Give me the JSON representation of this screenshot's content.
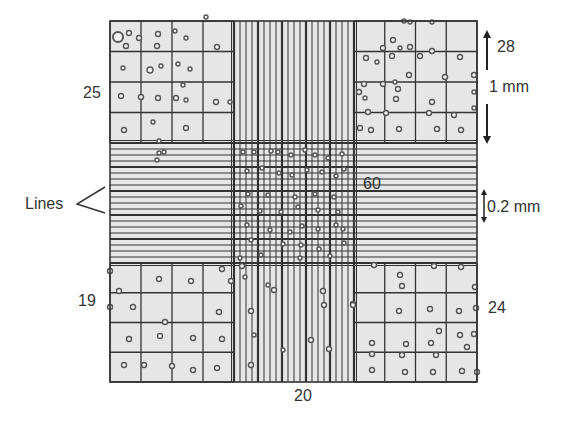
{
  "figure": {
    "colors": {
      "background": "#ffffff",
      "grid_fill": "#e6e6e6",
      "line": "#333333",
      "cell": "#555555"
    }
  },
  "labels": {
    "top_left_count": "25",
    "top_right_count": "28",
    "bottom_left_count": "19",
    "bottom_right_count": "24",
    "center_count": "60",
    "bottom_center_count": "20",
    "large_square_size": "1 mm",
    "small_square_size": "0.2 mm",
    "lines_pointer": "Lines"
  },
  "grid": {
    "outer": {
      "x0": 110,
      "y0": 21,
      "x1": 477,
      "y1": 382
    },
    "center_band": {
      "x0": 234,
      "x1": 354,
      "y0": 143,
      "y1": 263
    },
    "corner_subdivisions": 4,
    "center_subdivisions": 5,
    "lines_per_center_subdivision": 4
  },
  "cells": {
    "top_left": [
      [
        118,
        37,
        5
      ],
      [
        129,
        33,
        2.5
      ],
      [
        126,
        46,
        2.5
      ],
      [
        139,
        38,
        2.5
      ],
      [
        158,
        34,
        2.5
      ],
      [
        157,
        46,
        2.5
      ],
      [
        175,
        31,
        2
      ],
      [
        186,
        38,
        2
      ],
      [
        123,
        68,
        2
      ],
      [
        150,
        70,
        3
      ],
      [
        161,
        66,
        2
      ],
      [
        178,
        64,
        2
      ],
      [
        190,
        69,
        2
      ],
      [
        121,
        96,
        2.5
      ],
      [
        141,
        97,
        2.5
      ],
      [
        158,
        98,
        2.5
      ],
      [
        186,
        100,
        2
      ],
      [
        176,
        98,
        2.5
      ],
      [
        216,
        102,
        2.5
      ],
      [
        183,
        85,
        2
      ],
      [
        124,
        130,
        2.5
      ],
      [
        186,
        128,
        2.5
      ],
      [
        153,
        122,
        2
      ],
      [
        159,
        141,
        2
      ],
      [
        206,
        17,
        2
      ],
      [
        217,
        47,
        2.5
      ],
      [
        230,
        102,
        2
      ]
    ],
    "top_right": [
      [
        410,
        22,
        2
      ],
      [
        432,
        22,
        2
      ],
      [
        392,
        56,
        2.5
      ],
      [
        410,
        47,
        2.5
      ],
      [
        420,
        56,
        2.5
      ],
      [
        432,
        51,
        2.5
      ],
      [
        460,
        57,
        2.5
      ],
      [
        366,
        58,
        2.5
      ],
      [
        383,
        48,
        2.5
      ],
      [
        393,
        40,
        2.5
      ],
      [
        377,
        62,
        2
      ],
      [
        400,
        48,
        2
      ],
      [
        364,
        84,
        2.5
      ],
      [
        383,
        84,
        2.5
      ],
      [
        395,
        82,
        2
      ],
      [
        398,
        89,
        2.5
      ],
      [
        409,
        75,
        2.5
      ],
      [
        445,
        77,
        2.5
      ],
      [
        474,
        75,
        2.5
      ],
      [
        359,
        92,
        2.5
      ],
      [
        365,
        98,
        2
      ],
      [
        396,
        99,
        2.5
      ],
      [
        432,
        102,
        2.5
      ],
      [
        474,
        108,
        2
      ],
      [
        368,
        112,
        2.5
      ],
      [
        386,
        113,
        2.5
      ],
      [
        429,
        113,
        2.5
      ],
      [
        454,
        115,
        2.5
      ],
      [
        360,
        128,
        2.5
      ],
      [
        371,
        130,
        2.5
      ],
      [
        399,
        129,
        2.5
      ],
      [
        437,
        129,
        2.5
      ],
      [
        461,
        130,
        2.5
      ],
      [
        474,
        92,
        2
      ],
      [
        404,
        21,
        2
      ]
    ],
    "center": [
      [
        243,
        152,
        2
      ],
      [
        254,
        152,
        2
      ],
      [
        271,
        151,
        2
      ],
      [
        278,
        152,
        2
      ],
      [
        291,
        155,
        2
      ],
      [
        305,
        150,
        2
      ],
      [
        315,
        155,
        2
      ],
      [
        328,
        158,
        2
      ],
      [
        342,
        154,
        2
      ],
      [
        247,
        171,
        2
      ],
      [
        262,
        168,
        2
      ],
      [
        279,
        173,
        2
      ],
      [
        292,
        175,
        2
      ],
      [
        307,
        170,
        2
      ],
      [
        322,
        172,
        2
      ],
      [
        336,
        176,
        2
      ],
      [
        344,
        169,
        2
      ],
      [
        248,
        194,
        2
      ],
      [
        268,
        195,
        2
      ],
      [
        295,
        197,
        2
      ],
      [
        315,
        194,
        2
      ],
      [
        334,
        197,
        2
      ],
      [
        241,
        206,
        2
      ],
      [
        260,
        211,
        2
      ],
      [
        281,
        212,
        2
      ],
      [
        298,
        207,
        2
      ],
      [
        318,
        210,
        2
      ],
      [
        338,
        212,
        2
      ],
      [
        247,
        225,
        2
      ],
      [
        270,
        230,
        2
      ],
      [
        290,
        232,
        2
      ],
      [
        302,
        226,
        2
      ],
      [
        318,
        229,
        2
      ],
      [
        336,
        225,
        2
      ],
      [
        343,
        229,
        2
      ],
      [
        251,
        240,
        2
      ],
      [
        283,
        244,
        2
      ],
      [
        301,
        245,
        2
      ],
      [
        319,
        249,
        2
      ],
      [
        344,
        243,
        2
      ],
      [
        240,
        258,
        2
      ],
      [
        261,
        255,
        2
      ],
      [
        300,
        258,
        2
      ],
      [
        330,
        256,
        2
      ],
      [
        159,
        153,
        2
      ],
      [
        157,
        160,
        2
      ],
      [
        164,
        152,
        2
      ]
    ],
    "bottom_left": [
      [
        110,
        271,
        2.5
      ],
      [
        159,
        279,
        2.5
      ],
      [
        191,
        281,
        2.5
      ],
      [
        222,
        269,
        2.5
      ],
      [
        231,
        281,
        2.5
      ],
      [
        119,
        291,
        2.5
      ],
      [
        110,
        307,
        2.5
      ],
      [
        133,
        307,
        2.5
      ],
      [
        219,
        312,
        2.5
      ],
      [
        165,
        322,
        2.5
      ],
      [
        129,
        339,
        2.5
      ],
      [
        160,
        336,
        2.5
      ],
      [
        193,
        338,
        2.5
      ],
      [
        222,
        339,
        2.5
      ],
      [
        124,
        365,
        2.5
      ],
      [
        144,
        365,
        2.5
      ],
      [
        172,
        366,
        2.5
      ],
      [
        193,
        370,
        2.5
      ],
      [
        217,
        368,
        2.5
      ],
      [
        242,
        266,
        2.5
      ],
      [
        245,
        277,
        2
      ],
      [
        251,
        311,
        2.5
      ],
      [
        251,
        365,
        2.5
      ]
    ],
    "bottom_right": [
      [
        274,
        290,
        2.5
      ],
      [
        323,
        291,
        2.5
      ],
      [
        324,
        305,
        2.5
      ],
      [
        353,
        304,
        2.5
      ],
      [
        311,
        340,
        2.5
      ],
      [
        329,
        349,
        2.5
      ],
      [
        254,
        335,
        2
      ],
      [
        268,
        285,
        2
      ],
      [
        283,
        350,
        2
      ],
      [
        374,
        265,
        2.5
      ],
      [
        400,
        275,
        2.5
      ],
      [
        402,
        286,
        2.5
      ],
      [
        434,
        266,
        2.5
      ],
      [
        461,
        267,
        2.5
      ],
      [
        475,
        287,
        2.5
      ],
      [
        353,
        305,
        2.5
      ],
      [
        399,
        311,
        2.5
      ],
      [
        430,
        309,
        2.5
      ],
      [
        459,
        311,
        2.5
      ],
      [
        476,
        308,
        2.5
      ],
      [
        439,
        331,
        2.5
      ],
      [
        460,
        335,
        2.5
      ],
      [
        474,
        334,
        2.5
      ],
      [
        372,
        343,
        2.5
      ],
      [
        406,
        344,
        2.5
      ],
      [
        431,
        343,
        2.5
      ],
      [
        467,
        347,
        2.5
      ],
      [
        372,
        354,
        2.5
      ],
      [
        402,
        355,
        2.5
      ],
      [
        436,
        355,
        2.5
      ],
      [
        372,
        370,
        2.5
      ],
      [
        405,
        372,
        2.5
      ],
      [
        433,
        372,
        2.5
      ],
      [
        462,
        371,
        2.5
      ],
      [
        477,
        372,
        2.5
      ]
    ]
  }
}
